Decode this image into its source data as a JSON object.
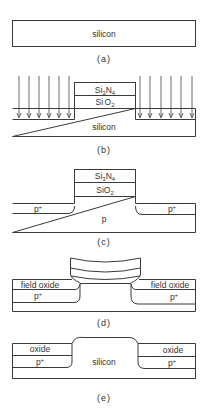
{
  "figure": {
    "panels": [
      {
        "id": "a",
        "caption": "(a)",
        "labels": {
          "body": "silicon"
        }
      },
      {
        "id": "b",
        "caption": "(b)",
        "labels": {
          "nitride": "Si3N4",
          "nitride_sub": "3",
          "nitride_sub2": "4",
          "oxide": "SiO2",
          "body": "silicon"
        },
        "implant_arrows": {
          "left_count": 6,
          "right_count": 6
        }
      },
      {
        "id": "c",
        "caption": "(c)",
        "labels": {
          "nitride": "Si3N4",
          "oxide": "SiO2",
          "left_doped": "p+",
          "right_doped": "p+",
          "body": "p"
        }
      },
      {
        "id": "d",
        "caption": "(d)",
        "labels": {
          "left_oxide": "field oxide",
          "right_oxide": "field oxide",
          "left_doped": "p+",
          "right_doped": "p+"
        }
      },
      {
        "id": "e",
        "caption": "(e)",
        "labels": {
          "left_oxide": "oxide",
          "right_oxide": "oxide",
          "left_doped": "p+",
          "right_doped": "p+",
          "body": "silicon"
        }
      }
    ],
    "text": {
      "silicon": "silicon",
      "Si": "Si",
      "N": "N",
      "O": "O",
      "sub3": "3",
      "sub4": "4",
      "sub2": "2",
      "p": "p",
      "plus": "+",
      "field_oxide": "field oxide",
      "oxide": "oxide",
      "cap_a": "(a)",
      "cap_b": "(b)",
      "cap_c": "(c)",
      "cap_d": "(d)",
      "cap_e": "(e)"
    }
  }
}
